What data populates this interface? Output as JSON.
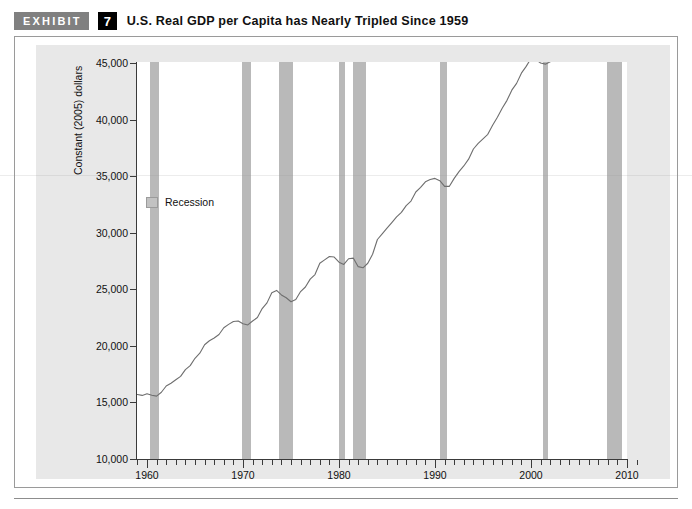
{
  "header": {
    "exhibit_label": "EXHIBIT",
    "exhibit_number": "7",
    "title": "U.S. Real GDP per Capita has Nearly Tripled Since 1959"
  },
  "legend": {
    "recession_label": "Recession",
    "swatch_color": "#c2c2c2"
  },
  "axes": {
    "y_title": "Constant (2005) dollars",
    "y_ticks": [
      "10,000",
      "15,000",
      "20,000",
      "25,000",
      "30,000",
      "35,000",
      "40,000",
      "45,000"
    ],
    "x_ticks": [
      "1960",
      "1970",
      "1980",
      "1990",
      "2000",
      "2010"
    ]
  },
  "chart_data": {
    "type": "line",
    "title": "U.S. Real GDP per Capita has Nearly Tripled Since 1959",
    "xlabel": "",
    "ylabel": "Constant (2005) dollars",
    "xlim": [
      1959,
      2011
    ],
    "ylim": [
      10000,
      45000
    ],
    "ytick_values": [
      10000,
      15000,
      20000,
      25000,
      30000,
      35000,
      40000,
      45000
    ],
    "xtick_values": [
      1960,
      1970,
      1980,
      1990,
      2000,
      2010
    ],
    "xtick_minor_step": 1,
    "grid": false,
    "legend_position": "inside-upper-left",
    "line_color": "#6e6e6e",
    "recession_band_color": "#b9b9b9",
    "series": [
      {
        "name": "U.S. Real GDP per Capita",
        "x": [
          1959.0,
          1959.5,
          1960.0,
          1960.5,
          1961.0,
          1961.5,
          1962.0,
          1962.5,
          1963.0,
          1963.5,
          1964.0,
          1964.5,
          1965.0,
          1965.5,
          1966.0,
          1966.5,
          1967.0,
          1967.5,
          1968.0,
          1968.5,
          1969.0,
          1969.5,
          1970.0,
          1970.5,
          1971.0,
          1971.5,
          1972.0,
          1972.5,
          1973.0,
          1973.5,
          1974.0,
          1974.5,
          1975.0,
          1975.5,
          1976.0,
          1976.5,
          1977.0,
          1977.5,
          1978.0,
          1978.5,
          1979.0,
          1979.5,
          1980.0,
          1980.5,
          1981.0,
          1981.5,
          1982.0,
          1982.5,
          1983.0,
          1983.5,
          1984.0,
          1984.5,
          1985.0,
          1985.5,
          1986.0,
          1986.5,
          1987.0,
          1987.5,
          1988.0,
          1988.5,
          1989.0,
          1989.5,
          1990.0,
          1990.5,
          1991.0,
          1991.5,
          1992.0,
          1992.5,
          1993.0,
          1993.5,
          1994.0,
          1994.5,
          1995.0,
          1995.5,
          1996.0,
          1996.5,
          1997.0,
          1997.5,
          1998.0,
          1998.5,
          1999.0,
          1999.5,
          2000.0,
          2000.5,
          2001.0,
          2001.5,
          2002.0,
          2002.5,
          2003.0,
          2003.5,
          2004.0,
          2004.5,
          2005.0,
          2005.5,
          2006.0,
          2006.5,
          2007.0,
          2007.5,
          2008.0,
          2008.5,
          2009.0,
          2009.5,
          2010.0,
          2010.5,
          2011.0
        ],
        "y": [
          15700,
          15620,
          15760,
          15640,
          15560,
          15900,
          16450,
          16700,
          17000,
          17300,
          17900,
          18250,
          18900,
          19350,
          20100,
          20450,
          20700,
          21000,
          21600,
          21900,
          22150,
          22200,
          21950,
          21850,
          22200,
          22500,
          23300,
          23800,
          24700,
          24900,
          24500,
          24250,
          23900,
          24100,
          24800,
          25200,
          25900,
          26300,
          27300,
          27600,
          27900,
          27850,
          27400,
          27200,
          27700,
          27750,
          27000,
          26900,
          27300,
          28100,
          29400,
          29900,
          30400,
          30900,
          31400,
          31800,
          32400,
          32800,
          33600,
          34000,
          34500,
          34700,
          34800,
          34600,
          34100,
          34100,
          34800,
          35400,
          35900,
          36500,
          37400,
          37900,
          38300,
          38700,
          39500,
          40200,
          41000,
          41700,
          42600,
          43200,
          44100,
          44700,
          45400,
          45300,
          45000,
          44900,
          45100,
          45500,
          46200,
          47000,
          47900,
          48500,
          49100,
          49600,
          50200,
          50400,
          50600,
          50700,
          50200,
          49100,
          48400,
          48600,
          49200,
          49600,
          49800
        ]
      }
    ],
    "recession_bands": [
      {
        "start": 1960.3,
        "end": 1961.2,
        "label": "1960-61 recession"
      },
      {
        "start": 1969.9,
        "end": 1970.8,
        "label": "1969-70 recession"
      },
      {
        "start": 1973.8,
        "end": 1975.2,
        "label": "1973-75 recession"
      },
      {
        "start": 1980.0,
        "end": 1980.6,
        "label": "1980 recession"
      },
      {
        "start": 1981.5,
        "end": 1982.8,
        "label": "1981-82 recession"
      },
      {
        "start": 1990.5,
        "end": 1991.2,
        "label": "1990-91 recession"
      },
      {
        "start": 2001.2,
        "end": 2001.8,
        "label": "2001 recession"
      },
      {
        "start": 2007.9,
        "end": 2009.5,
        "label": "2007-09 recession"
      }
    ]
  }
}
